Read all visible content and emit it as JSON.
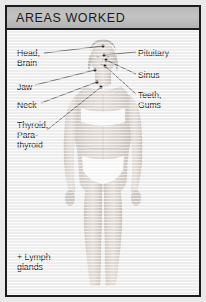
{
  "poster": {
    "title": "AREAS WORKED",
    "colors": {
      "frame_border": "#1d1d1d",
      "title_band": "#bbbbbb",
      "title_text": "#1a1a1a",
      "panel_background": "#f6f6f6",
      "label_text": "#1f1f1f",
      "leader_line": "#5a5a5a",
      "marker_dot": "#222222",
      "skin": "#dcd6d2",
      "garment": "#ffffff"
    },
    "labels_left": [
      {
        "text": "Head,\nBrain",
        "x": 10,
        "y": 18
      },
      {
        "text": "Jaw",
        "x": 10,
        "y": 52
      },
      {
        "text": "Neck",
        "x": 10,
        "y": 70
      },
      {
        "text": "Thyroid,\nPara-\nthyroid",
        "x": 10,
        "y": 90
      }
    ],
    "labels_right": [
      {
        "text": "Pituitary",
        "x": 131,
        "y": 18
      },
      {
        "text": "Sinus",
        "x": 131,
        "y": 40
      },
      {
        "text": "Teeth,\nGums",
        "x": 131,
        "y": 60
      }
    ],
    "footnote": "+ Lymph\nglands",
    "figure_description": "full-body front view of a standing female figure in white bra and briefs"
  }
}
